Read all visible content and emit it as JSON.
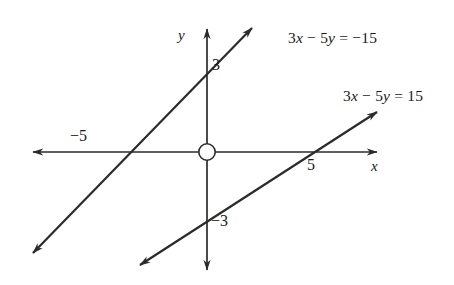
{
  "figure": {
    "type": "coordinate-graph",
    "background_color": "#ffffff",
    "ink_color": "#2b2b2b"
  },
  "axes": {
    "x_label": "x",
    "y_label": "y",
    "origin_marker": "open-circle"
  },
  "ticks": {
    "x_negative_five": "−5",
    "x_positive_five": "5",
    "y_positive_three": "3",
    "y_negative_three": "−3"
  },
  "equations": {
    "upper_line": "3x − 5y = −15",
    "lower_line": "3x − 5y = 15"
  },
  "chart_data": {
    "type": "line",
    "title": "",
    "xlabel": "x",
    "ylabel": "y",
    "grid": false,
    "legend": "inline-labels",
    "xlim": [
      -9,
      9
    ],
    "ylim": [
      -6,
      6
    ],
    "xticks": [
      -5,
      5
    ],
    "xticklabels": [
      "−5",
      "5"
    ],
    "yticks": [
      3,
      -3
    ],
    "yticklabels": [
      "3",
      "−3"
    ],
    "series": [
      {
        "name": "3x − 5y = −15",
        "slope": 0.6,
        "intercept": 3,
        "x_intercept": -5,
        "y_intercept": 3,
        "points": [
          [
            -5,
            0
          ],
          [
            0,
            3
          ]
        ],
        "arrows": "both"
      },
      {
        "name": "3x − 5y = 15",
        "slope": 0.6,
        "intercept": -3,
        "x_intercept": 5,
        "y_intercept": -3,
        "points": [
          [
            5,
            0
          ],
          [
            0,
            -3
          ]
        ],
        "arrows": "both"
      }
    ],
    "annotations": [
      {
        "text": "3x − 5y = −15",
        "x": 6.2,
        "y": 5.2
      },
      {
        "text": "3x − 5y = 15",
        "x": 7.4,
        "y": 3.1
      }
    ]
  }
}
